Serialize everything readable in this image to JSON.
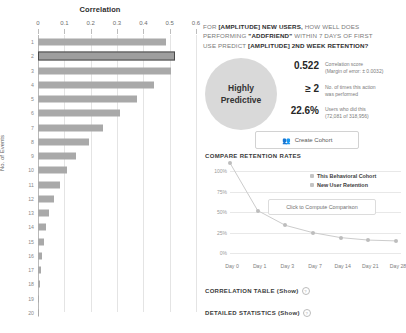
{
  "correlation_chart": {
    "title": "Correlation",
    "y_axis_title": "No. of Events"
  },
  "question": {
    "line1_a": "FOR ",
    "line1_b": "[AMPLITUDE] NEW USERS,",
    "line1_c": " HOW WELL DOES",
    "line2_a": "PERFORMING ",
    "line2_b": "\"ADDFRIEND\"",
    "line2_c": " WITHIN 7 DAYS OF FIRST",
    "line3_a": "USE PREDICT ",
    "line3_b": "[AMPLITUDE] 2ND WEEK RETENTION?"
  },
  "verdict": {
    "label": "Highly\nPredictive"
  },
  "stats": [
    {
      "value": "0.522",
      "desc": "Correlation score\n(Margin of error: ± 0.0032)"
    },
    {
      "value": "≥ 2",
      "desc": "No. of times this action\nwas performed"
    },
    {
      "value": "22.6%",
      "desc": "Users who did this\n(72,081 of 318,956)"
    }
  ],
  "create_cohort_button": {
    "label": "Create Cohort",
    "icon": "people-icon"
  },
  "compare_section": {
    "title": "COMPARE RETENTION RATES"
  },
  "tooltip": {
    "label": "Click to Compute Comparison"
  },
  "legend": [
    {
      "label": "This Behavioral Cohort",
      "color": "#c3c3c3"
    },
    {
      "label": "New User Retention",
      "color": "#c3c3c3"
    }
  ],
  "disclosures": [
    {
      "label": "CORRELATION TABLE (Show)"
    },
    {
      "label": "DETAILED STATISTICS (Show)"
    }
  ],
  "chart_data": [
    {
      "type": "bar",
      "title": "Correlation",
      "xlabel": "Correlation",
      "ylabel": "No. of Events",
      "orientation": "horizontal",
      "xlim": [
        0,
        0.6
      ],
      "xticks": [
        "0",
        "0.1",
        "0.2",
        "0.3",
        "0.4",
        "0.5",
        "0.6"
      ],
      "xtick_values": [
        0,
        0.1,
        0.2,
        0.3,
        0.4,
        0.5,
        0.6
      ],
      "grid": true,
      "legend": "none",
      "categories": [
        "1",
        "2",
        "3",
        "4",
        "5",
        "6",
        "7",
        "8",
        "9",
        "10",
        "11",
        "12",
        "13",
        "14",
        "15",
        "16",
        "17",
        "18",
        "19",
        "20"
      ],
      "values": [
        0.485,
        0.522,
        0.505,
        0.44,
        0.375,
        0.31,
        0.245,
        0.195,
        0.145,
        0.11,
        0.082,
        0.06,
        0.043,
        0.032,
        0.024,
        0.016,
        0.011,
        0.007,
        0.003,
        0.001
      ],
      "highlight_index": 1
    },
    {
      "type": "line",
      "title": "COMPARE RETENTION RATES",
      "xlabel": "",
      "ylabel": "",
      "ylim": [
        0,
        100
      ],
      "yticks": [
        "100%",
        "75%",
        "50%",
        "25%",
        "0%"
      ],
      "ytick_values": [
        100,
        75,
        50,
        25,
        0
      ],
      "x": [
        "Day 0",
        "Day 1",
        "Day 3",
        "Day 7",
        "Day 14",
        "Day 21",
        "Day 28"
      ],
      "grid": true,
      "legend_position": "top-right",
      "series": [
        {
          "name": "New User Retention",
          "values": [
            100,
            42,
            24,
            15,
            9,
            6,
            5
          ]
        },
        {
          "name": "This Behavioral Cohort",
          "values": []
        }
      ]
    }
  ]
}
